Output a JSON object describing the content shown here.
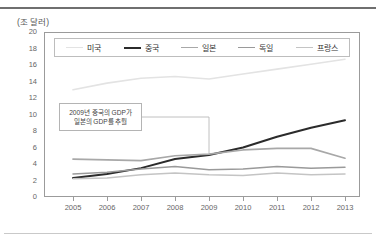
{
  "chart_data": {
    "type": "line",
    "title": "",
    "unit_label": "(조 달러)",
    "xlabel": "",
    "ylabel": "",
    "categories": [
      "2005",
      "2006",
      "2007",
      "2008",
      "2009",
      "2010",
      "2011",
      "2012",
      "2013"
    ],
    "x": [
      2005,
      2006,
      2007,
      2008,
      2009,
      2010,
      2011,
      2012,
      2013
    ],
    "ylim": [
      0,
      20
    ],
    "y_ticks": [
      "0",
      "2",
      "4",
      "6",
      "8",
      "10",
      "12",
      "14",
      "16",
      "18",
      "20"
    ],
    "y_tick_values": [
      0,
      2,
      4,
      6,
      8,
      10,
      12,
      14,
      16,
      18,
      20
    ],
    "xlim": [
      2005,
      2013
    ],
    "grid": false,
    "legend_position": "top-inside",
    "series": [
      {
        "name": "미국",
        "color": "#e3e3e3",
        "width": 1.6,
        "values": [
          13.0,
          13.8,
          14.4,
          14.6,
          14.3,
          14.9,
          15.5,
          16.1,
          16.7
        ]
      },
      {
        "name": "중국",
        "color": "#2b2b2b",
        "width": 2.0,
        "values": [
          2.3,
          2.8,
          3.5,
          4.6,
          5.1,
          6.0,
          7.3,
          8.4,
          9.3
        ]
      },
      {
        "name": "일본",
        "color": "#a8a8a8",
        "width": 1.7,
        "values": [
          4.6,
          4.5,
          4.4,
          5.0,
          5.2,
          5.7,
          5.9,
          5.9,
          4.7
        ]
      },
      {
        "name": "독일",
        "color": "#9a9a9a",
        "width": 1.5,
        "values": [
          2.8,
          3.0,
          3.4,
          3.7,
          3.3,
          3.4,
          3.7,
          3.5,
          3.6
        ]
      },
      {
        "name": "프랑스",
        "color": "#c4c4c4",
        "width": 1.5,
        "values": [
          2.2,
          2.3,
          2.7,
          2.9,
          2.7,
          2.6,
          2.9,
          2.7,
          2.8
        ]
      }
    ],
    "annotations": [
      {
        "line1": "2009년 중국의 GDP가",
        "line2": "일본의 GDP를 추월",
        "target_x": 2009,
        "target_y": 5.1
      }
    ]
  }
}
